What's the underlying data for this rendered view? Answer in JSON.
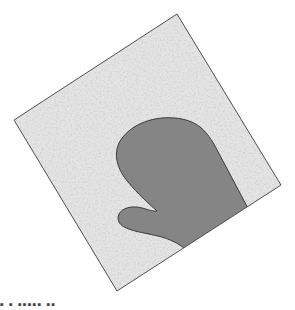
{
  "figure": {
    "colors": {
      "square_fill": "#e4e4e4",
      "square_border": "#4f4f4f",
      "mitten_fill": "#858585",
      "mitten_border": "#3a3a3a"
    }
  },
  "caption": {
    "text": "▪ ▪ ▪▪▪▪▪ ▪▪"
  }
}
